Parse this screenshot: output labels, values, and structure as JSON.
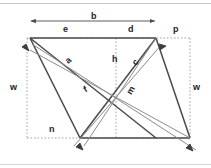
{
  "figure": {
    "background_color": "#ffffff",
    "stroke_color": "#4a4a4a",
    "guide_color": "#9a9a9a",
    "label_color": "#232323",
    "labels": [
      {
        "id": "b",
        "text": "b",
        "x": 91,
        "y": 13,
        "rot": "none",
        "role": "overall-width-dimension"
      },
      {
        "id": "e",
        "text": "e",
        "x": 63,
        "y": 26,
        "rot": "none",
        "role": "top-left-segment"
      },
      {
        "id": "d",
        "text": "d",
        "x": 128,
        "y": 26,
        "rot": "none",
        "role": "top-right-segment"
      },
      {
        "id": "p",
        "text": "p",
        "x": 173,
        "y": 26,
        "rot": "none",
        "role": "right-offset"
      },
      {
        "id": "a",
        "text": "a",
        "x": 66,
        "y": 57,
        "rot": "rot-a",
        "role": "upper-diagonal"
      },
      {
        "id": "h",
        "text": "h",
        "x": 112,
        "y": 56,
        "rot": "none",
        "role": "vertical-height"
      },
      {
        "id": "c",
        "text": "c",
        "x": 133,
        "y": 59,
        "rot": "rot-c",
        "role": "right-side-edge"
      },
      {
        "id": "w-left",
        "text": "w",
        "x": 11,
        "y": 84,
        "rot": "none",
        "role": "left-height-dimension"
      },
      {
        "id": "w-right",
        "text": "w",
        "x": 193,
        "y": 84,
        "rot": "none",
        "role": "right-height-dimension"
      },
      {
        "id": "f",
        "text": "f",
        "x": 84,
        "y": 86,
        "rot": "rot-f",
        "role": "long-diagonal"
      },
      {
        "id": "m",
        "text": "m",
        "x": 127,
        "y": 87,
        "rot": "rot-m",
        "role": "short-diagonal"
      },
      {
        "id": "n",
        "text": "n",
        "x": 49,
        "y": 126,
        "rot": "none",
        "role": "bottom-offset"
      }
    ],
    "points": {
      "top_left": {
        "x": 30,
        "y": 38
      },
      "top_right": {
        "x": 156,
        "y": 38
      },
      "bottom_left": {
        "x": 80,
        "y": 138
      },
      "bottom_right": {
        "x": 190,
        "y": 138
      },
      "box_left": {
        "x": 27,
        "y": 38
      },
      "box_right": {
        "x": 190,
        "y": 38
      },
      "box_top": {
        "x": 27,
        "y": 38
      },
      "box_bottom": {
        "x": 27,
        "y": 138
      },
      "h_foot": {
        "x": 116,
        "y": 38
      },
      "h_base": {
        "x": 116,
        "y": 138
      }
    },
    "dimension_lines": [
      {
        "id": "b-dim",
        "x1": 30,
        "y1": 21,
        "x2": 156,
        "y2": 21,
        "arrows": "both"
      }
    ],
    "angle_marks": [
      {
        "id": "angle-top-left",
        "x": 30,
        "y": 38
      },
      {
        "id": "angle-top-right",
        "x": 156,
        "y": 38
      },
      {
        "id": "angle-bottom-left",
        "x": 80,
        "y": 138
      },
      {
        "id": "angle-bottom-right",
        "x": 190,
        "y": 138
      }
    ]
  }
}
